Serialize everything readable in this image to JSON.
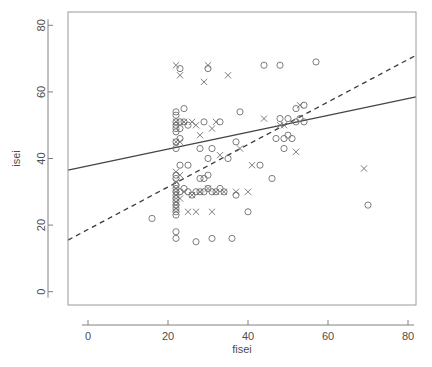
{
  "chart_data": {
    "type": "scatter",
    "title": "",
    "xlabel": "fisei",
    "ylabel": "isei",
    "xlim": [
      -5,
      82
    ],
    "ylim": [
      -4,
      84
    ],
    "xticks": [
      0,
      20,
      40,
      60,
      80
    ],
    "yticks": [
      0,
      20,
      40,
      60,
      80
    ],
    "xtick_labels": [
      "0",
      "20",
      "40",
      "60",
      "80"
    ],
    "ytick_labels": [
      "0",
      "20",
      "40",
      "60",
      "80"
    ],
    "grid": false,
    "legend": "none",
    "marker_colors": {
      "circle": "#6e6e6e",
      "cross": "#6e6e6e"
    },
    "line_colors": {
      "solid": "#444444",
      "dashed": "#3a3a3a"
    },
    "series": [
      {
        "name": "circle",
        "marker": "o",
        "points": [
          [
            16,
            22
          ],
          [
            22,
            16
          ],
          [
            22,
            18
          ],
          [
            22,
            23
          ],
          [
            22,
            24
          ],
          [
            22,
            25
          ],
          [
            22,
            26
          ],
          [
            22,
            27
          ],
          [
            22,
            28
          ],
          [
            22,
            29
          ],
          [
            22,
            30
          ],
          [
            22,
            31
          ],
          [
            22,
            32
          ],
          [
            22,
            34
          ],
          [
            22,
            35
          ],
          [
            22,
            43
          ],
          [
            22,
            45
          ],
          [
            22,
            48
          ],
          [
            22,
            49
          ],
          [
            22,
            50
          ],
          [
            22,
            51
          ],
          [
            22,
            53
          ],
          [
            22,
            54
          ],
          [
            23,
            30
          ],
          [
            23,
            38
          ],
          [
            23,
            46
          ],
          [
            23,
            49
          ],
          [
            23,
            51
          ],
          [
            23,
            67
          ],
          [
            24,
            31
          ],
          [
            24,
            51
          ],
          [
            24,
            55
          ],
          [
            25,
            30
          ],
          [
            25,
            38
          ],
          [
            25,
            50
          ],
          [
            26,
            29
          ],
          [
            27,
            15
          ],
          [
            27,
            30
          ],
          [
            28,
            30
          ],
          [
            28,
            34
          ],
          [
            28,
            43
          ],
          [
            29,
            30
          ],
          [
            29,
            34
          ],
          [
            29,
            51
          ],
          [
            30,
            31
          ],
          [
            30,
            35
          ],
          [
            30,
            40
          ],
          [
            30,
            67
          ],
          [
            31,
            16
          ],
          [
            31,
            30
          ],
          [
            31,
            43
          ],
          [
            32,
            30
          ],
          [
            33,
            31
          ],
          [
            33,
            51
          ],
          [
            34,
            30
          ],
          [
            35,
            40
          ],
          [
            36,
            16
          ],
          [
            37,
            29
          ],
          [
            37,
            45
          ],
          [
            38,
            54
          ],
          [
            40,
            24
          ],
          [
            43,
            38
          ],
          [
            44,
            68
          ],
          [
            46,
            34
          ],
          [
            47,
            46
          ],
          [
            48,
            52
          ],
          [
            48,
            68
          ],
          [
            49,
            43
          ],
          [
            49,
            46
          ],
          [
            50,
            47
          ],
          [
            50,
            52
          ],
          [
            51,
            46
          ],
          [
            52,
            51
          ],
          [
            52,
            55
          ],
          [
            53,
            52
          ],
          [
            54,
            51
          ],
          [
            54,
            56
          ],
          [
            57,
            69
          ],
          [
            70,
            26
          ]
        ]
      },
      {
        "name": "cross",
        "marker": "x",
        "points": [
          [
            22,
            25
          ],
          [
            22,
            27
          ],
          [
            22,
            29
          ],
          [
            22,
            31
          ],
          [
            22,
            33
          ],
          [
            22,
            36
          ],
          [
            22,
            45
          ],
          [
            22,
            51
          ],
          [
            22,
            68
          ],
          [
            23,
            28
          ],
          [
            23,
            35
          ],
          [
            23,
            45
          ],
          [
            23,
            65
          ],
          [
            24,
            30
          ],
          [
            24,
            51
          ],
          [
            25,
            24
          ],
          [
            26,
            29
          ],
          [
            26,
            51
          ],
          [
            27,
            24
          ],
          [
            27,
            50
          ],
          [
            28,
            30
          ],
          [
            28,
            47
          ],
          [
            29,
            63
          ],
          [
            30,
            68
          ],
          [
            30,
            31
          ],
          [
            31,
            24
          ],
          [
            31,
            49
          ],
          [
            32,
            30
          ],
          [
            32,
            51
          ],
          [
            33,
            41
          ],
          [
            34,
            30
          ],
          [
            35,
            65
          ],
          [
            37,
            30
          ],
          [
            38,
            43
          ],
          [
            40,
            30
          ],
          [
            41,
            38
          ],
          [
            44,
            52
          ],
          [
            48,
            50
          ],
          [
            49,
            50
          ],
          [
            52,
            42
          ],
          [
            53,
            56
          ],
          [
            69,
            37
          ]
        ]
      }
    ],
    "fit_lines": [
      {
        "style": "solid",
        "x0": -5,
        "y0": 36.5,
        "x1": 82,
        "y1": 58.5
      },
      {
        "style": "dashed",
        "x0": -5,
        "y0": 15.5,
        "x1": 82,
        "y1": 71.0
      }
    ]
  }
}
